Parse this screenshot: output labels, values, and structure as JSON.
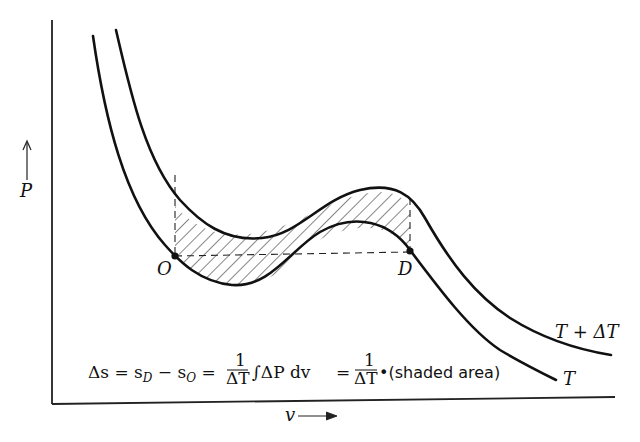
{
  "figure": {
    "type": "P-v isotherm diagram (van der Waals loop)",
    "y_axis_label": "P",
    "x_axis_label": "v",
    "curves": [
      {
        "name": "T",
        "label": "T"
      },
      {
        "name": "T+dT",
        "label": "T + ΔT"
      }
    ],
    "points": [
      {
        "name": "O",
        "label": "O"
      },
      {
        "name": "D",
        "label": "D"
      }
    ],
    "shaded_region": "area between isotherms T and T + ΔT from O to D (hatched)",
    "equation": {
      "lhs": "Δs = s",
      "sub_D": "D",
      "minus": " − s",
      "sub_O": "O",
      "eq1": " = ",
      "frac_num": "1",
      "frac_den": "ΔT",
      "integral": "∫ΔP dv",
      "eq2": " = ",
      "frac2_num": "1",
      "frac2_den": "ΔT",
      "tail": "•(shaded area)"
    },
    "colors": {
      "ink": "#111111",
      "background": "#ffffff"
    }
  }
}
